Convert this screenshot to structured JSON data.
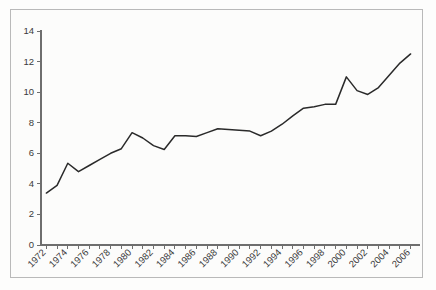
{
  "chart_data": {
    "type": "line",
    "title": "",
    "subtitle": "",
    "xlabel": "",
    "ylabel": "",
    "xlim": [
      1971.5,
      2006.5
    ],
    "ylim": [
      0,
      14
    ],
    "grid": false,
    "legend": null,
    "legend_position": "none",
    "line_color": "#2a2a2a",
    "axis_color": "#6e6e6e",
    "frame_color": "#b9b9b9",
    "background_color": "#fcfcfb",
    "y_ticks": [
      0,
      2,
      4,
      6,
      8,
      10,
      12,
      14
    ],
    "y_tick_labels": [
      "0",
      "2",
      "4",
      "6",
      "8",
      "10",
      "12",
      "14"
    ],
    "x_tick_labels": [
      "1972",
      "1974",
      "1976",
      "1978",
      "1980",
      "1982",
      "1984",
      "1986",
      "1988",
      "1990",
      "1992",
      "1994",
      "1996",
      "1998",
      "2000",
      "2002",
      "2004",
      "2006"
    ],
    "x_tick_label_rotation": 45,
    "x_minor_tick_interval": 1,
    "x_major_tick_interval": 2,
    "x": [
      1972,
      1973,
      1974,
      1975,
      1976,
      1977,
      1978,
      1979,
      1980,
      1981,
      1982,
      1983,
      1984,
      1985,
      1986,
      1987,
      1988,
      1989,
      1990,
      1991,
      1992,
      1993,
      1994,
      1995,
      1996,
      1997,
      1998,
      1999,
      2000,
      2001,
      2002,
      2003,
      2004,
      2005,
      2006
    ],
    "values": [
      3.4,
      3.9,
      5.35,
      4.8,
      5.2,
      5.6,
      6.0,
      6.3,
      7.35,
      7.0,
      6.5,
      6.25,
      7.15,
      7.15,
      7.1,
      7.35,
      7.6,
      7.55,
      7.5,
      7.45,
      7.15,
      7.45,
      7.9,
      8.45,
      8.95,
      9.05,
      9.2,
      9.2,
      11.0,
      10.1,
      9.85,
      10.3,
      11.1,
      11.9,
      12.5
    ],
    "series": [
      {
        "name": "series-1",
        "color": "#2a2a2a",
        "values": [
          3.4,
          3.9,
          5.35,
          4.8,
          5.2,
          5.6,
          6.0,
          6.3,
          7.35,
          7.0,
          6.5,
          6.25,
          7.15,
          7.15,
          7.1,
          7.35,
          7.6,
          7.55,
          7.5,
          7.45,
          7.15,
          7.45,
          7.9,
          8.45,
          8.95,
          9.05,
          9.2,
          9.2,
          11.0,
          10.1,
          9.85,
          10.3,
          11.1,
          11.9,
          12.5
        ]
      }
    ]
  },
  "geometry": {
    "plot_left": 41,
    "plot_right": 416,
    "plot_top": 31,
    "plot_bottom": 245,
    "tick_size": 4
  }
}
